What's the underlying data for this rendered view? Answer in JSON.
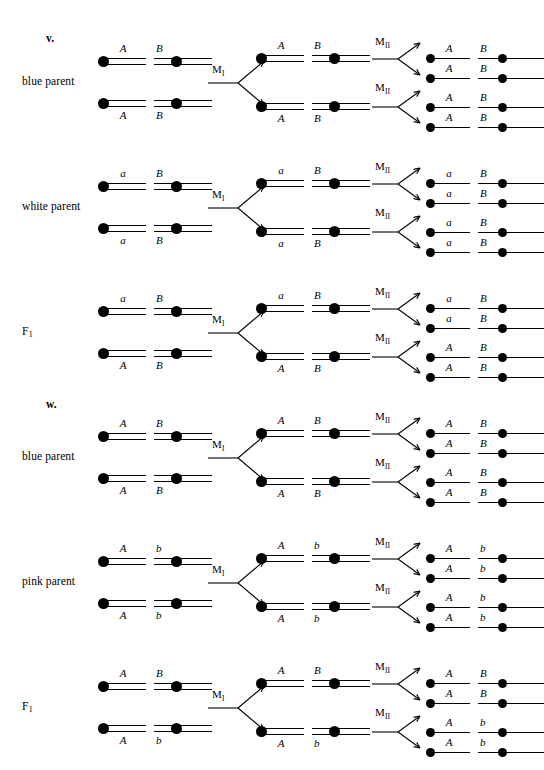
{
  "figure": {
    "background_color": "#ffffff",
    "ink_color": "#000000"
  },
  "stage_labels": {
    "meiosis_i": "M",
    "meiosis_i_numeral": "I",
    "meiosis_ii": "M",
    "meiosis_ii_numeral": "II"
  },
  "parts": [
    {
      "marker": "v."
    },
    {
      "marker": "w."
    }
  ],
  "rows": [
    {
      "part_marker": "v.",
      "label": "blue parent",
      "label_sub": "",
      "parent": {
        "top": {
          "gene1": "A",
          "gene2": "B"
        },
        "bottom": {
          "gene1": "A",
          "gene2": "B"
        }
      },
      "meiosis_i_products": [
        {
          "gene1": "A",
          "gene2": "B"
        },
        {
          "gene1": "A",
          "gene2": "B"
        }
      ],
      "meiosis_ii_products": [
        {
          "gene1": "A",
          "gene2": "B"
        },
        {
          "gene1": "A",
          "gene2": "B"
        },
        {
          "gene1": "A",
          "gene2": "B"
        },
        {
          "gene1": "A",
          "gene2": "B"
        }
      ]
    },
    {
      "part_marker": "",
      "label": "white parent",
      "label_sub": "",
      "parent": {
        "top": {
          "gene1": "a",
          "gene2": "B"
        },
        "bottom": {
          "gene1": "a",
          "gene2": "B"
        }
      },
      "meiosis_i_products": [
        {
          "gene1": "a",
          "gene2": "B"
        },
        {
          "gene1": "a",
          "gene2": "B"
        }
      ],
      "meiosis_ii_products": [
        {
          "gene1": "a",
          "gene2": "B"
        },
        {
          "gene1": "a",
          "gene2": "B"
        },
        {
          "gene1": "a",
          "gene2": "B"
        },
        {
          "gene1": "a",
          "gene2": "B"
        }
      ]
    },
    {
      "part_marker": "",
      "label": "F",
      "label_sub": "1",
      "parent": {
        "top": {
          "gene1": "a",
          "gene2": "B"
        },
        "bottom": {
          "gene1": "A",
          "gene2": "B"
        }
      },
      "meiosis_i_products": [
        {
          "gene1": "a",
          "gene2": "B"
        },
        {
          "gene1": "A",
          "gene2": "B"
        }
      ],
      "meiosis_ii_products": [
        {
          "gene1": "a",
          "gene2": "B"
        },
        {
          "gene1": "a",
          "gene2": "B"
        },
        {
          "gene1": "A",
          "gene2": "B"
        },
        {
          "gene1": "A",
          "gene2": "B"
        }
      ]
    },
    {
      "part_marker": "w.",
      "label": "blue parent",
      "label_sub": "",
      "parent": {
        "top": {
          "gene1": "A",
          "gene2": "B"
        },
        "bottom": {
          "gene1": "A",
          "gene2": "B"
        }
      },
      "meiosis_i_products": [
        {
          "gene1": "A",
          "gene2": "B"
        },
        {
          "gene1": "A",
          "gene2": "B"
        }
      ],
      "meiosis_ii_products": [
        {
          "gene1": "A",
          "gene2": "B"
        },
        {
          "gene1": "A",
          "gene2": "B"
        },
        {
          "gene1": "A",
          "gene2": "B"
        },
        {
          "gene1": "A",
          "gene2": "B"
        }
      ]
    },
    {
      "part_marker": "",
      "label": "pink parent",
      "label_sub": "",
      "parent": {
        "top": {
          "gene1": "A",
          "gene2": "b"
        },
        "bottom": {
          "gene1": "A",
          "gene2": "b"
        }
      },
      "meiosis_i_products": [
        {
          "gene1": "A",
          "gene2": "b"
        },
        {
          "gene1": "A",
          "gene2": "b"
        }
      ],
      "meiosis_ii_products": [
        {
          "gene1": "A",
          "gene2": "b"
        },
        {
          "gene1": "A",
          "gene2": "b"
        },
        {
          "gene1": "A",
          "gene2": "b"
        },
        {
          "gene1": "A",
          "gene2": "b"
        }
      ]
    },
    {
      "part_marker": "",
      "label": "F",
      "label_sub": "1",
      "parent": {
        "top": {
          "gene1": "A",
          "gene2": "B"
        },
        "bottom": {
          "gene1": "A",
          "gene2": "b"
        }
      },
      "meiosis_i_products": [
        {
          "gene1": "A",
          "gene2": "B"
        },
        {
          "gene1": "A",
          "gene2": "b"
        }
      ],
      "meiosis_ii_products": [
        {
          "gene1": "A",
          "gene2": "B"
        },
        {
          "gene1": "A",
          "gene2": "B"
        },
        {
          "gene1": "A",
          "gene2": "b"
        },
        {
          "gene1": "A",
          "gene2": "b"
        }
      ]
    }
  ]
}
